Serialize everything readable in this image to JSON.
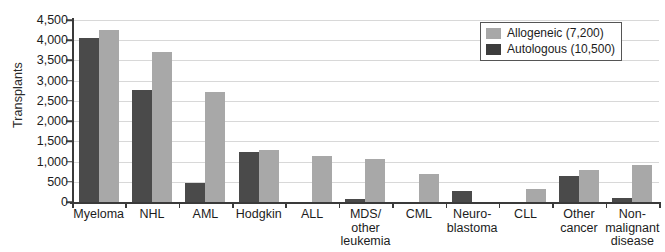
{
  "chart_data": {
    "type": "bar",
    "title": "",
    "xlabel": "",
    "ylabel": "Transplants",
    "ylim": [
      0,
      4500
    ],
    "ytick_labels": [
      "0",
      "500",
      "1,000",
      "1,500",
      "2,000",
      "2,500",
      "3,000",
      "3,500",
      "4,000",
      "4,500"
    ],
    "ytick_values": [
      0,
      500,
      1000,
      1500,
      2000,
      2500,
      3000,
      3500,
      4000,
      4500
    ],
    "grid": true,
    "legend_position": "top-right",
    "categories": [
      "Myeloma",
      "NHL",
      "AML",
      "Hodgkin",
      "ALL",
      "MDS/\nother\nleukemia",
      "CML",
      "Neuro-\nblastoma",
      "CLL",
      "Other\ncancer",
      "Non-\nmalignant\ndisease"
    ],
    "category_lines": [
      [
        "Myeloma"
      ],
      [
        "NHL"
      ],
      [
        "AML"
      ],
      [
        "Hodgkin"
      ],
      [
        "ALL"
      ],
      [
        "MDS/",
        "other",
        "leukemia"
      ],
      [
        "CML"
      ],
      [
        "Neuro-",
        "blastoma"
      ],
      [
        "CLL"
      ],
      [
        "Other",
        "cancer"
      ],
      [
        "Non-",
        "malignant",
        "disease"
      ]
    ],
    "series": [
      {
        "name": "Autologous (10,500)",
        "color": "#4a4a4a",
        "values": [
          4050,
          2770,
          470,
          1230,
          0,
          70,
          0,
          270,
          0,
          640,
          110
        ]
      },
      {
        "name": "Allogeneic (7,200)",
        "color": "#a8a8a8",
        "values": [
          4250,
          3710,
          2730,
          1290,
          1150,
          1060,
          690,
          0,
          330,
          790,
          920
        ]
      }
    ]
  },
  "legend": {
    "items": [
      {
        "label": "Allogeneic (7,200)",
        "swatch": "light"
      },
      {
        "label": "Autologous (10,500)",
        "swatch": "dark"
      }
    ]
  }
}
